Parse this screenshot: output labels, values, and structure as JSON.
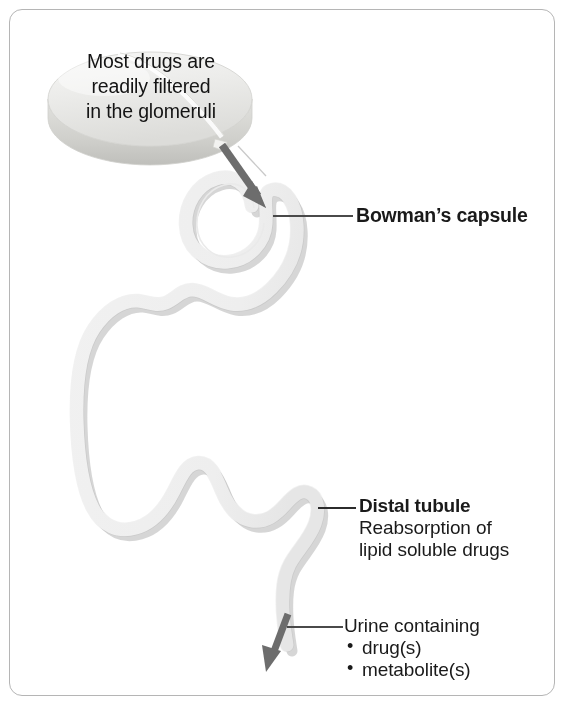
{
  "figure": {
    "kind": "nephron-drug-filtration-diagram",
    "width": 571,
    "height": 721,
    "background_color": "#ffffff",
    "border_color": "#b5b5b5"
  },
  "pill": {
    "name": "drug-tablet",
    "text_lines": [
      "Most drugs are",
      "readily filtered",
      "in the glomeruli"
    ],
    "face_color": "#ededec",
    "edge_color": "#d9d9d7",
    "text_color": "#141414"
  },
  "tubule": {
    "name": "nephron-tubule",
    "fill_color": "#fdfdfd",
    "outline_color": "#e3e3e3",
    "shadow_color": "#d2d2d2"
  },
  "arrows": {
    "filtration_arrow": {
      "name": "filtration-arrow",
      "color": "#6b6b6b",
      "direction": "down-right"
    },
    "urine_arrow": {
      "name": "urine-outflow-arrow",
      "color": "#6b6b6b",
      "direction": "down-left"
    }
  },
  "labels": {
    "bowmans_capsule": {
      "text": "Bowman’s capsule",
      "bold": true
    },
    "distal_tubule": {
      "title": "Distal tubule",
      "line2": "Reabsorption of",
      "line3": "lipid soluble drugs"
    },
    "urine": {
      "heading": "Urine containing",
      "items": [
        "drug(s)",
        "metabolite(s)"
      ]
    }
  },
  "leader_lines": {
    "color": "#4a4a4a",
    "bowmans": {
      "x1": 273,
      "y1": 216,
      "x2": 353,
      "y2": 216
    },
    "distal": {
      "x1": 318,
      "y1": 508,
      "x2": 356,
      "y2": 508
    },
    "urine": {
      "x1": 287,
      "y1": 627,
      "x2": 343,
      "y2": 627
    }
  }
}
